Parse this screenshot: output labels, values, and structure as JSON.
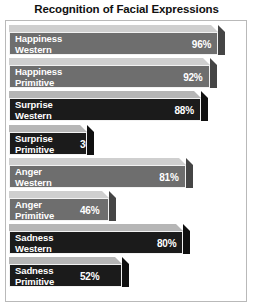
{
  "chart_data": {
    "type": "bar",
    "orientation": "horizontal",
    "title": "Recognition of Facial Expressions",
    "xlabel": "",
    "ylabel": "",
    "xlim": [
      0,
      100
    ],
    "grid": false,
    "legend": null,
    "value_suffix": "%",
    "categories": [
      "Happiness Western",
      "Happiness Primitive",
      "Surprise Western",
      "Surprise Primitive",
      "Anger Western",
      "Anger Primitive",
      "Sadness Western",
      "Sadness Primitive"
    ],
    "values": [
      96,
      92,
      88,
      36,
      81,
      46,
      80,
      52
    ],
    "bars": [
      {
        "label_line1": "Happiness",
        "label_line2": "Western",
        "label": "Happiness\nWestern",
        "value": 96,
        "value_text": "96%",
        "tone": "gray",
        "value_position": "inside-right"
      },
      {
        "label_line1": "Happiness",
        "label_line2": "Primitive",
        "label": "Happiness\nPrimitive",
        "value": 92,
        "value_text": "92%",
        "tone": "gray",
        "value_position": "inside-right"
      },
      {
        "label_line1": "Surprise",
        "label_line2": "Western",
        "label": "Surprise\nWestern",
        "value": 88,
        "value_text": "88%",
        "tone": "dark",
        "value_position": "inside-right"
      },
      {
        "label_line1": "Surprise",
        "label_line2": "Primitive",
        "label": "Surprise\nPrimitive",
        "value": 36,
        "value_text": "36%",
        "tone": "dark",
        "value_position": "inside-mid"
      },
      {
        "label_line1": "Anger",
        "label_line2": "Western",
        "label": "Anger\nWestern",
        "value": 81,
        "value_text": "81%",
        "tone": "gray",
        "value_position": "inside-right"
      },
      {
        "label_line1": "Anger",
        "label_line2": "Primitive",
        "label": "Anger\nPrimitive",
        "value": 46,
        "value_text": "46%",
        "tone": "gray",
        "value_position": "inside-mid"
      },
      {
        "label_line1": "Sadness",
        "label_line2": "Western",
        "label": "Sadness\nWestern",
        "value": 80,
        "value_text": "80%",
        "tone": "dark",
        "value_position": "inside-right"
      },
      {
        "label_line1": "Sadness",
        "label_line2": "Primitive",
        "label": "Sadness\nPrimitive",
        "value": 52,
        "value_text": "52%",
        "tone": "dark",
        "value_position": "inside-mid"
      }
    ],
    "colors": {
      "background": "#ffffff",
      "title": "#111111",
      "frame": "#b9b9b9",
      "bar_gray_front": "#6e6e6e",
      "bar_gray_top": "#cfcfcf",
      "bar_gray_side": "#454545",
      "bar_dark_front": "#1b1b1b",
      "bar_dark_top": "#b6b6b6",
      "bar_dark_side": "#101010",
      "label_text": "#ffffff",
      "value_text": "#ffffff"
    }
  }
}
